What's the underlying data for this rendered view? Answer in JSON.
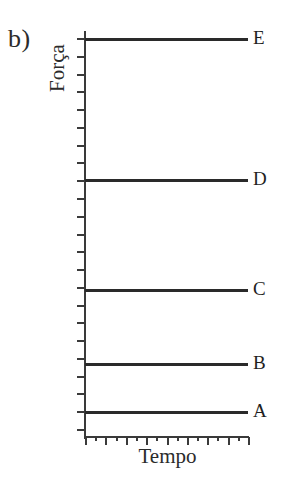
{
  "figure": {
    "panel_label": "b)",
    "background_color": "#ffffff",
    "ink_color": "#2a2a2a",
    "width": 297,
    "height": 477
  },
  "chart_data": {
    "type": "line",
    "title": "",
    "subtitle": "",
    "xlabel": "Tempo",
    "ylabel": "Força",
    "annotations": [
      "b)"
    ],
    "grid": false,
    "legend_position": "right-inline",
    "x_axis": {
      "label": "Tempo",
      "tick_labels": [],
      "major_ticks": 9,
      "minor_ticks": 8,
      "range_described": "arbitrary units, unlabelled"
    },
    "y_axis": {
      "label": "Força",
      "tick_labels": [],
      "major_ticks": 23,
      "range_described": "arbitrary units, unlabelled"
    },
    "series": [
      {
        "name": "E",
        "values": [
          0.977,
          0.977
        ],
        "x": [
          0,
          1
        ],
        "style": "constant horizontal line"
      },
      {
        "name": "D",
        "values": [
          0.63,
          0.63
        ],
        "x": [
          0,
          1
        ],
        "style": "constant horizontal line"
      },
      {
        "name": "C",
        "values": [
          0.36,
          0.36
        ],
        "x": [
          0,
          1
        ],
        "style": "constant horizontal line"
      },
      {
        "name": "B",
        "values": [
          0.178,
          0.178
        ],
        "x": [
          0,
          1
        ],
        "style": "constant horizontal line"
      },
      {
        "name": "A",
        "values": [
          0.059,
          0.059
        ],
        "x": [
          0,
          1
        ],
        "style": "constant horizontal line"
      }
    ],
    "series_labels": [
      "E",
      "D",
      "C",
      "B",
      "A"
    ]
  },
  "traces": [
    {
      "label": "E",
      "top": 38
    },
    {
      "label": "D",
      "top": 179
    },
    {
      "label": "C",
      "top": 289
    },
    {
      "label": "B",
      "top": 363
    },
    {
      "label": "A",
      "top": 411
    }
  ]
}
